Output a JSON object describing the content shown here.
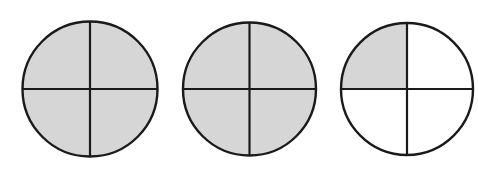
{
  "diagram": {
    "title": "",
    "colors": {
      "shade": "#d6d6d6",
      "unshaded": "#ffffff",
      "stroke": "#1a1a1a",
      "background": "#ffffff"
    },
    "circles": [
      {
        "id": "circle-1",
        "cx": 90,
        "cy": 89,
        "r": 67.5,
        "parts": 4,
        "shaded_quadrants": [
          "top-left",
          "top-right",
          "bottom-left",
          "bottom-right"
        ],
        "shaded_count": 4
      },
      {
        "id": "circle-2",
        "cx": 249.5,
        "cy": 89,
        "r": 66.5,
        "parts": 4,
        "shaded_quadrants": [
          "top-left",
          "top-right",
          "bottom-left",
          "bottom-right"
        ],
        "shaded_count": 4
      },
      {
        "id": "circle-3",
        "cx": 407,
        "cy": 89,
        "r": 66,
        "parts": 4,
        "shaded_quadrants": [
          "top-left"
        ],
        "shaded_count": 1
      }
    ],
    "total_shaded_quarters": 9,
    "fraction_represented": "9/4"
  }
}
